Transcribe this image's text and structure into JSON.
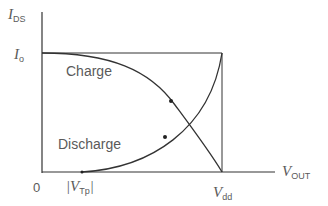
{
  "diagram": {
    "y_axis_label": {
      "main": "I",
      "sub": "DS"
    },
    "x_axis_label": {
      "main": "V",
      "sub": "OUT"
    },
    "level_label": {
      "main": "I",
      "sub": "o"
    },
    "origin_label": "0",
    "vtp_label": {
      "prefix": "|V",
      "sub": "Tp",
      "suffix": "|"
    },
    "vdd_label": {
      "main": "V",
      "sub": "dd"
    },
    "curves": [
      {
        "name": "Charge",
        "label": "Charge"
      },
      {
        "name": "Discharge",
        "label": "Discharge"
      }
    ]
  }
}
